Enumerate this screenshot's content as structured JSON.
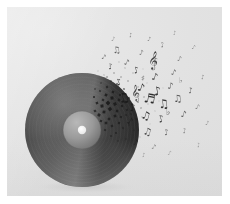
{
  "artwork": {
    "title": "Vinyl record dissolving into musical notes",
    "subject": "vinyl-record",
    "style": "dispersion-effect",
    "orientation": "landscape",
    "palette": {
      "page_border": "#ffffff",
      "background_light": "#e9e9e9",
      "background_base": "#e2e2e2",
      "background_dark": "#dcdcdc",
      "record_body_dark": "#101010",
      "record_body_mid": "#2c2c2c",
      "record_sheen": "#8d8d8d",
      "record_label": "#9a9a9a",
      "record_label_edge": "#6e6e6e",
      "center_hole": "#f4f4f4",
      "note_ink": "#1b1b1b",
      "shadow": "#c8c8c8"
    },
    "canvas": {
      "x": 7,
      "y": 7,
      "width": 215,
      "height": 189
    },
    "record": {
      "center_x": 75,
      "center_y": 123,
      "radius": 57,
      "label_radius": 19,
      "hole_radius": 4.2,
      "sheen_angle_deg": 118
    },
    "shadow": {
      "center_x": 78,
      "center_y": 180,
      "rx": 50,
      "ry": 6
    },
    "dispersion": {
      "direction": "right-and-upward",
      "origin_x": 110,
      "origin_y": 100,
      "fragment_count": 72,
      "note_count": 46,
      "description": "Record edge fragments into fine square particles that become musical notes drifting up and to the right"
    },
    "glyphs": [
      {
        "name": "eighth-note",
        "symbol": "♪"
      },
      {
        "name": "beamed-eighth-notes",
        "symbol": "♫"
      },
      {
        "name": "beamed-sixteenth-notes",
        "symbol": "♬"
      },
      {
        "name": "quarter-note",
        "symbol": "♩"
      },
      {
        "name": "treble-clef",
        "symbol": "𝄞"
      },
      {
        "name": "flat-sign",
        "symbol": "♭"
      },
      {
        "name": "sharp-sign",
        "symbol": "♯"
      }
    ],
    "particles": [
      {
        "x": 101,
        "y": 96,
        "s": 3.4,
        "o": 0.92
      },
      {
        "x": 105,
        "y": 91,
        "s": 3.0,
        "o": 0.9
      },
      {
        "x": 99,
        "y": 88,
        "s": 2.6,
        "o": 0.85
      },
      {
        "x": 108,
        "y": 97,
        "s": 2.9,
        "o": 0.88
      },
      {
        "x": 112,
        "y": 93,
        "s": 2.4,
        "o": 0.84
      },
      {
        "x": 103,
        "y": 102,
        "s": 3.2,
        "o": 0.9
      },
      {
        "x": 110,
        "y": 104,
        "s": 2.5,
        "o": 0.82
      },
      {
        "x": 96,
        "y": 93,
        "s": 2.2,
        "o": 0.8
      },
      {
        "x": 115,
        "y": 99,
        "s": 2.1,
        "o": 0.78
      },
      {
        "x": 106,
        "y": 85,
        "s": 2.3,
        "o": 0.82
      },
      {
        "x": 100,
        "y": 80,
        "s": 2.0,
        "o": 0.76
      },
      {
        "x": 113,
        "y": 88,
        "s": 1.9,
        "o": 0.74
      },
      {
        "x": 118,
        "y": 95,
        "s": 2.2,
        "o": 0.76
      },
      {
        "x": 108,
        "y": 109,
        "s": 2.6,
        "o": 0.84
      },
      {
        "x": 114,
        "y": 110,
        "s": 2.0,
        "o": 0.74
      },
      {
        "x": 120,
        "y": 103,
        "s": 1.8,
        "o": 0.7
      },
      {
        "x": 97,
        "y": 105,
        "s": 2.8,
        "o": 0.86
      },
      {
        "x": 102,
        "y": 112,
        "s": 2.4,
        "o": 0.8
      },
      {
        "x": 95,
        "y": 99,
        "s": 3.0,
        "o": 0.88
      },
      {
        "x": 93,
        "y": 84,
        "s": 1.8,
        "o": 0.7
      },
      {
        "x": 122,
        "y": 91,
        "s": 1.7,
        "o": 0.66
      },
      {
        "x": 117,
        "y": 82,
        "s": 1.6,
        "o": 0.64
      },
      {
        "x": 110,
        "y": 77,
        "s": 1.7,
        "o": 0.66
      },
      {
        "x": 104,
        "y": 74,
        "s": 1.5,
        "o": 0.6
      },
      {
        "x": 125,
        "y": 97,
        "s": 1.6,
        "o": 0.62
      },
      {
        "x": 119,
        "y": 108,
        "s": 1.7,
        "o": 0.64
      },
      {
        "x": 112,
        "y": 116,
        "s": 2.0,
        "o": 0.72
      },
      {
        "x": 105,
        "y": 119,
        "s": 2.3,
        "o": 0.76
      },
      {
        "x": 99,
        "y": 116,
        "s": 2.6,
        "o": 0.8
      },
      {
        "x": 92,
        "y": 108,
        "s": 2.7,
        "o": 0.82
      },
      {
        "x": 90,
        "y": 96,
        "s": 2.4,
        "o": 0.78
      },
      {
        "x": 128,
        "y": 88,
        "s": 1.4,
        "o": 0.58
      },
      {
        "x": 131,
        "y": 95,
        "s": 1.3,
        "o": 0.54
      },
      {
        "x": 124,
        "y": 107,
        "s": 1.4,
        "o": 0.56
      },
      {
        "x": 116,
        "y": 121,
        "s": 1.6,
        "o": 0.6
      },
      {
        "x": 109,
        "y": 126,
        "s": 1.8,
        "o": 0.64
      },
      {
        "x": 121,
        "y": 74,
        "s": 1.3,
        "o": 0.52
      },
      {
        "x": 114,
        "y": 70,
        "s": 1.2,
        "o": 0.5
      },
      {
        "x": 107,
        "y": 66,
        "s": 1.2,
        "o": 0.48
      },
      {
        "x": 100,
        "y": 70,
        "s": 1.3,
        "o": 0.52
      },
      {
        "x": 134,
        "y": 101,
        "s": 1.2,
        "o": 0.48
      },
      {
        "x": 129,
        "y": 112,
        "s": 1.3,
        "o": 0.5
      },
      {
        "x": 122,
        "y": 118,
        "s": 1.3,
        "o": 0.5
      },
      {
        "x": 137,
        "y": 90,
        "s": 1.1,
        "o": 0.44
      },
      {
        "x": 131,
        "y": 80,
        "s": 1.1,
        "o": 0.44
      },
      {
        "x": 126,
        "y": 66,
        "s": 1.0,
        "o": 0.4
      },
      {
        "x": 118,
        "y": 61,
        "s": 1.0,
        "o": 0.4
      },
      {
        "x": 141,
        "y": 97,
        "s": 1.0,
        "o": 0.38
      },
      {
        "x": 135,
        "y": 110,
        "s": 1.0,
        "o": 0.38
      },
      {
        "x": 127,
        "y": 123,
        "s": 1.1,
        "o": 0.42
      },
      {
        "x": 103,
        "y": 59,
        "s": 0.9,
        "o": 0.36
      },
      {
        "x": 112,
        "y": 55,
        "s": 0.9,
        "o": 0.34
      },
      {
        "x": 145,
        "y": 87,
        "s": 0.9,
        "o": 0.34
      },
      {
        "x": 140,
        "y": 76,
        "s": 0.9,
        "o": 0.32
      },
      {
        "x": 148,
        "y": 104,
        "s": 0.9,
        "o": 0.32
      },
      {
        "x": 133,
        "y": 130,
        "s": 0.9,
        "o": 0.34
      },
      {
        "x": 119,
        "y": 132,
        "s": 1.2,
        "o": 0.46
      },
      {
        "x": 111,
        "y": 134,
        "s": 1.4,
        "o": 0.52
      },
      {
        "x": 98,
        "y": 123,
        "s": 2.0,
        "o": 0.7
      },
      {
        "x": 104,
        "y": 129,
        "s": 1.7,
        "o": 0.6
      },
      {
        "x": 94,
        "y": 114,
        "s": 2.2,
        "o": 0.74
      },
      {
        "x": 88,
        "y": 104,
        "s": 2.3,
        "o": 0.76
      },
      {
        "x": 87,
        "y": 90,
        "s": 1.9,
        "o": 0.68
      },
      {
        "x": 94,
        "y": 76,
        "s": 1.4,
        "o": 0.54
      },
      {
        "x": 88,
        "y": 82,
        "s": 1.5,
        "o": 0.58
      },
      {
        "x": 152,
        "y": 94,
        "s": 0.8,
        "o": 0.28
      },
      {
        "x": 143,
        "y": 117,
        "s": 0.8,
        "o": 0.28
      },
      {
        "x": 156,
        "y": 81,
        "s": 0.8,
        "o": 0.26
      },
      {
        "x": 125,
        "y": 139,
        "s": 0.8,
        "o": 0.28
      },
      {
        "x": 97,
        "y": 68,
        "s": 1.0,
        "o": 0.4
      },
      {
        "x": 91,
        "y": 64,
        "s": 0.9,
        "o": 0.34
      },
      {
        "x": 136,
        "y": 62,
        "s": 0.8,
        "o": 0.28
      }
    ],
    "notes": [
      {
        "x": 118,
        "y": 95,
        "glyph": "♫",
        "size": 13,
        "rot": -14,
        "o": 0.92
      },
      {
        "x": 133,
        "y": 84,
        "glyph": "♪",
        "size": 11,
        "rot": 18,
        "o": 0.9
      },
      {
        "x": 126,
        "y": 104,
        "glyph": "♪",
        "size": 10,
        "rot": -8,
        "o": 0.88
      },
      {
        "x": 142,
        "y": 96,
        "glyph": "♬",
        "size": 13,
        "rot": 10,
        "o": 0.9
      },
      {
        "x": 113,
        "y": 78,
        "glyph": "♪",
        "size": 9,
        "rot": -22,
        "o": 0.84
      },
      {
        "x": 151,
        "y": 88,
        "glyph": "♪",
        "size": 12,
        "rot": -10,
        "o": 0.88
      },
      {
        "x": 138,
        "y": 112,
        "glyph": "♫",
        "size": 11,
        "rot": 16,
        "o": 0.86
      },
      {
        "x": 122,
        "y": 117,
        "glyph": "♪",
        "size": 9,
        "rot": 24,
        "o": 0.8
      },
      {
        "x": 157,
        "y": 101,
        "glyph": "♫",
        "size": 12,
        "rot": -6,
        "o": 0.86
      },
      {
        "x": 147,
        "y": 73,
        "glyph": "♪",
        "size": 10,
        "rot": 14,
        "o": 0.82
      },
      {
        "x": 130,
        "y": 66,
        "glyph": "♪",
        "size": 9,
        "rot": -16,
        "o": 0.78
      },
      {
        "x": 163,
        "y": 82,
        "glyph": "♪",
        "size": 9,
        "rot": 8,
        "o": 0.76
      },
      {
        "x": 155,
        "y": 115,
        "glyph": "♪",
        "size": 10,
        "rot": -18,
        "o": 0.78
      },
      {
        "x": 140,
        "y": 128,
        "glyph": "♫",
        "size": 10,
        "rot": 12,
        "o": 0.76
      },
      {
        "x": 119,
        "y": 58,
        "glyph": "♪",
        "size": 8,
        "rot": 20,
        "o": 0.7
      },
      {
        "x": 104,
        "y": 62,
        "glyph": "♪",
        "size": 8,
        "rot": -12,
        "o": 0.7
      },
      {
        "x": 171,
        "y": 95,
        "glyph": "♫",
        "size": 10,
        "rot": -4,
        "o": 0.74
      },
      {
        "x": 166,
        "y": 68,
        "glyph": "♪",
        "size": 8,
        "rot": 16,
        "o": 0.68
      },
      {
        "x": 150,
        "y": 56,
        "glyph": "♪",
        "size": 8,
        "rot": -20,
        "o": 0.66
      },
      {
        "x": 134,
        "y": 48,
        "glyph": "♪",
        "size": 7,
        "rot": 10,
        "o": 0.62
      },
      {
        "x": 176,
        "y": 110,
        "glyph": "♪",
        "size": 9,
        "rot": 12,
        "o": 0.68
      },
      {
        "x": 160,
        "y": 128,
        "glyph": "♪",
        "size": 8,
        "rot": -14,
        "o": 0.64
      },
      {
        "x": 128,
        "y": 138,
        "glyph": "♪",
        "size": 8,
        "rot": 18,
        "o": 0.62
      },
      {
        "x": 110,
        "y": 46,
        "glyph": "♫",
        "size": 9,
        "rot": -8,
        "o": 0.66
      },
      {
        "x": 96,
        "y": 52,
        "glyph": "♪",
        "size": 7,
        "rot": 22,
        "o": 0.6
      },
      {
        "x": 184,
        "y": 86,
        "glyph": "♪",
        "size": 8,
        "rot": -10,
        "o": 0.62
      },
      {
        "x": 172,
        "y": 54,
        "glyph": "♪",
        "size": 7,
        "rot": 14,
        "o": 0.56
      },
      {
        "x": 156,
        "y": 40,
        "glyph": "♪",
        "size": 7,
        "rot": -18,
        "o": 0.54
      },
      {
        "x": 142,
        "y": 34,
        "glyph": "♪",
        "size": 6,
        "rot": 8,
        "o": 0.5
      },
      {
        "x": 190,
        "y": 102,
        "glyph": "♪",
        "size": 7,
        "rot": 16,
        "o": 0.54
      },
      {
        "x": 178,
        "y": 126,
        "glyph": "♪",
        "size": 7,
        "rot": -12,
        "o": 0.52
      },
      {
        "x": 146,
        "y": 142,
        "glyph": "♪",
        "size": 7,
        "rot": 20,
        "o": 0.52
      },
      {
        "x": 124,
        "y": 30,
        "glyph": "♪",
        "size": 6,
        "rot": -14,
        "o": 0.48
      },
      {
        "x": 106,
        "y": 34,
        "glyph": "♪",
        "size": 6,
        "rot": 12,
        "o": 0.46
      },
      {
        "x": 196,
        "y": 72,
        "glyph": "♪",
        "size": 6,
        "rot": -6,
        "o": 0.46
      },
      {
        "x": 186,
        "y": 42,
        "glyph": "♪",
        "size": 6,
        "rot": 18,
        "o": 0.42
      },
      {
        "x": 168,
        "y": 28,
        "glyph": "♪",
        "size": 6,
        "rot": -10,
        "o": 0.4
      },
      {
        "x": 200,
        "y": 118,
        "glyph": "♪",
        "size": 6,
        "rot": 10,
        "o": 0.42
      },
      {
        "x": 192,
        "y": 140,
        "glyph": "♪",
        "size": 6,
        "rot": -16,
        "o": 0.38
      },
      {
        "x": 162,
        "y": 148,
        "glyph": "♪",
        "size": 6,
        "rot": 14,
        "o": 0.4
      },
      {
        "x": 137,
        "y": 150,
        "glyph": "♪",
        "size": 6,
        "rot": -8,
        "o": 0.4
      },
      {
        "x": 145,
        "y": 58,
        "glyph": "𝄞",
        "size": 16,
        "rot": 6,
        "o": 0.8
      },
      {
        "x": 129,
        "y": 90,
        "glyph": "𝄞",
        "size": 14,
        "rot": -8,
        "o": 0.76
      },
      {
        "x": 161,
        "y": 108,
        "glyph": "♭",
        "size": 9,
        "rot": 0,
        "o": 0.62
      },
      {
        "x": 136,
        "y": 74,
        "glyph": "♯",
        "size": 8,
        "rot": 0,
        "o": 0.58
      },
      {
        "x": 174,
        "y": 76,
        "glyph": "♭",
        "size": 8,
        "rot": 0,
        "o": 0.54
      }
    ]
  }
}
